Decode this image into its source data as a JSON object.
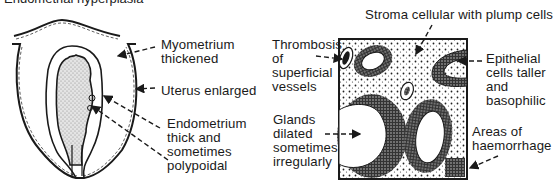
{
  "cut_title": "Endometrial hyperplasia",
  "left_figure": {
    "name": "uterus-section",
    "labels": {
      "myometrium": [
        "Myometrium",
        "thickened"
      ],
      "uterus": [
        "Uterus enlarged"
      ],
      "endometrium": [
        "Endometrium",
        "thick and",
        "sometimes",
        "polypoidal"
      ]
    }
  },
  "right_figure": {
    "name": "histology-section",
    "labels": {
      "stroma": [
        "Stroma cellular with plump cells"
      ],
      "thrombosis": [
        "Thrombosis",
        "of",
        "superficial",
        "vessels"
      ],
      "epithelial": [
        "Epithelial",
        "cells taller",
        "and",
        "basophilic"
      ],
      "glands": [
        "Glands",
        "dilated",
        "sometimes",
        "irregularly"
      ],
      "haemorrhage": [
        "Areas of",
        "haemorrhage"
      ]
    }
  },
  "colors": {
    "ink": "#1a1a1a",
    "stipple": "#9a9a9a",
    "background": "#ffffff"
  }
}
